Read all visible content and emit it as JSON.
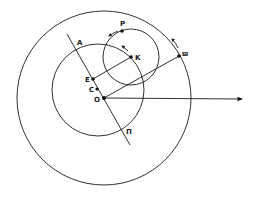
{
  "diagram": {
    "type": "geometric-astronomical-construction",
    "colors": {
      "ink": "#1a1a1a",
      "background": "#ffffff"
    },
    "circles": [
      {
        "id": "outer",
        "cx": 104,
        "cy": 98,
        "r": 87
      },
      {
        "id": "middle",
        "cx": 98,
        "cy": 90,
        "r": 46
      },
      {
        "id": "epicycle",
        "cx": 131,
        "cy": 57,
        "r": 28
      }
    ],
    "points": {
      "O": {
        "label": "O",
        "x": 104,
        "y": 98
      },
      "C": {
        "label": "C",
        "x": 97,
        "y": 89
      },
      "E": {
        "label": "E",
        "x": 93,
        "y": 79
      },
      "K": {
        "label": "K",
        "x": 131,
        "y": 57
      },
      "P": {
        "label": "P",
        "x": 122,
        "y": 31
      },
      "varpi": {
        "label": "ϖ",
        "x": 179,
        "y": 56
      }
    },
    "line_labels": {
      "A": {
        "label": "A",
        "x": 77,
        "y": 45
      },
      "Pi": {
        "label": "Π",
        "x": 126,
        "y": 134
      }
    }
  }
}
